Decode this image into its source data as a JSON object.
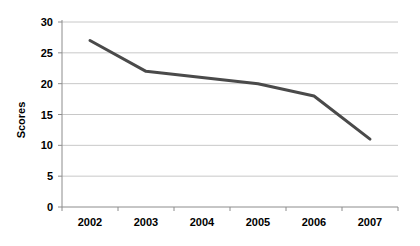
{
  "chart_data": {
    "type": "line",
    "title": "",
    "xlabel": "",
    "ylabel": "Scores",
    "categories": [
      "2002",
      "2003",
      "2004",
      "2005",
      "2006",
      "2007"
    ],
    "values": [
      27,
      22,
      21,
      20,
      18,
      11
    ],
    "series": [
      {
        "name": "Scores",
        "values": [
          27,
          22,
          21,
          20,
          18,
          11
        ]
      }
    ],
    "ylim": [
      0,
      30
    ],
    "ytick_labels": [
      "0",
      "5",
      "10",
      "15",
      "20",
      "25",
      "30"
    ],
    "ytick_values": [
      0,
      5,
      10,
      15,
      20,
      25,
      30
    ],
    "grid": "horizontal",
    "legend": "none",
    "colors": {
      "line": "#4a4a4a",
      "grid": "#c8c8c8",
      "axis": "#7f7f7f",
      "text": "#000000",
      "background": "#ffffff"
    },
    "line_width": 3
  }
}
